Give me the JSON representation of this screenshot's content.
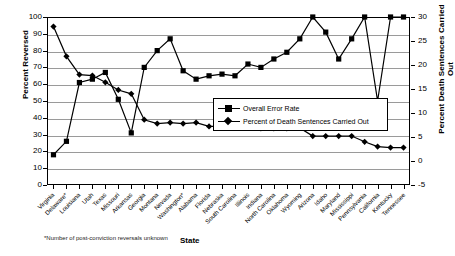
{
  "chart_data": {
    "type": "line",
    "title": "",
    "xlabel": "State",
    "ylabel": "Percent Reversed",
    "y2label": "Percent Death Sentences Carried Out",
    "ylim": [
      0,
      100
    ],
    "y2lim": [
      -5,
      30
    ],
    "grid": true,
    "legend_position": "center-right",
    "footnote": "*Number of post-conviction reversals unknown",
    "y_ticks": [
      0,
      10,
      20,
      30,
      40,
      50,
      60,
      70,
      80,
      90,
      100
    ],
    "y2_ticks": [
      -5,
      0,
      5,
      10,
      15,
      20,
      25,
      30
    ],
    "categories": [
      "Virginia",
      "Delaware*",
      "Louisiana",
      "Utah",
      "Texas",
      "Missouri",
      "Arkansas",
      "Georgia",
      "Montana",
      "Nevada",
      "Washington*",
      "Alabama",
      "Florida",
      "Nebraska",
      "South Carolina",
      "Illinois",
      "Indiana",
      "North Carolina",
      "Oklahoma",
      "Wyoming",
      "Arizona",
      "Idaho",
      "Maryland",
      "Mississippi",
      "Pennsylvania",
      "California",
      "Kentucky",
      "Tennessee"
    ],
    "series": [
      {
        "name": "Overall Error Rate",
        "axis": "left",
        "marker": "square",
        "values": [
          18,
          26,
          61,
          63,
          67,
          51,
          31,
          70,
          80,
          87,
          68,
          63,
          65,
          66,
          65,
          72,
          70,
          75,
          79,
          87,
          100,
          91,
          75,
          87,
          100,
          50,
          100,
          100
        ]
      },
      {
        "name": "Percent of Death Sentences Carried Out",
        "axis": "right",
        "marker": "diamond",
        "values": [
          28.0,
          21.8,
          18.0,
          17.8,
          16.4,
          14.8,
          14.0,
          8.6,
          7.8,
          8.0,
          7.8,
          8.0,
          7.2,
          7.2,
          7.4,
          6.9,
          6.8,
          6.8,
          6.8,
          6.9,
          5.2,
          5.2,
          5.2,
          5.2,
          4.0,
          3.0,
          2.8,
          2.8
        ]
      }
    ]
  },
  "legend": {
    "items": [
      {
        "label": "Overall Error Rate",
        "marker": "square"
      },
      {
        "label": "Percent of Death Sentences Carried Out",
        "marker": "diamond"
      }
    ]
  }
}
